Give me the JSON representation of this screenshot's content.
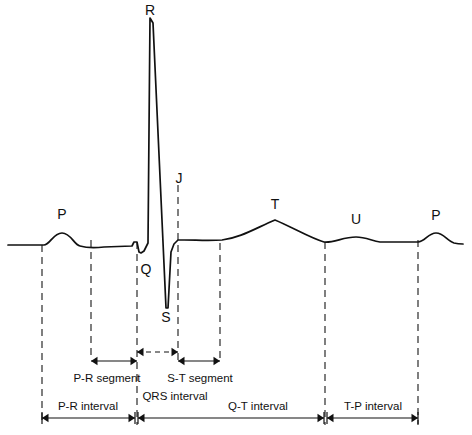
{
  "figure": {
    "background_color": "#ffffff",
    "line_color": "#111111",
    "width": 472,
    "height": 435
  },
  "wave_labels": [
    {
      "name": "p-wave-first",
      "text": "P",
      "x": 62,
      "y": 219
    },
    {
      "name": "r-wave",
      "text": "R",
      "x": 150,
      "y": 15
    },
    {
      "name": "q-wave",
      "text": "Q",
      "x": 146,
      "y": 274
    },
    {
      "name": "s-wave",
      "text": "S",
      "x": 166,
      "y": 322
    },
    {
      "name": "j-point",
      "text": "J",
      "x": 179,
      "y": 183
    },
    {
      "name": "t-wave",
      "text": "T",
      "x": 275,
      "y": 209
    },
    {
      "name": "u-wave",
      "text": "U",
      "x": 356,
      "y": 224
    },
    {
      "name": "p-wave-second",
      "text": "P",
      "x": 436,
      "y": 220
    }
  ],
  "guide_lines": [
    {
      "name": "guide-p-onset",
      "x": 42,
      "y1": 245,
      "y2": 425
    },
    {
      "name": "guide-p-offset",
      "x": 91,
      "y1": 240,
      "y2": 360
    },
    {
      "name": "guide-q-onset",
      "x": 137,
      "y1": 242,
      "y2": 425
    },
    {
      "name": "guide-j-point",
      "x": 178,
      "y1": 185,
      "y2": 360
    },
    {
      "name": "guide-st-end",
      "x": 220,
      "y1": 243,
      "y2": 360
    },
    {
      "name": "guide-t-offset",
      "x": 325,
      "y1": 242,
      "y2": 425
    },
    {
      "name": "guide-p2-onset",
      "x": 418,
      "y1": 240,
      "y2": 425
    }
  ],
  "annotations": {
    "segments": [
      {
        "name": "pr-segment",
        "label": "P-R segment",
        "x1": 91,
        "x2": 137,
        "y": 361,
        "label_x": 107,
        "label_y": 382,
        "style": "solid"
      },
      {
        "name": "qrs-interval",
        "label": "QRS interval",
        "x1": 137,
        "x2": 178,
        "y": 352,
        "label_x": 175,
        "label_y": 400,
        "style": "dashed"
      },
      {
        "name": "st-segment",
        "label": "S-T segment",
        "x1": 178,
        "x2": 220,
        "y": 361,
        "label_x": 200,
        "label_y": 382,
        "style": "solid"
      }
    ],
    "intervals": [
      {
        "name": "pr-interval",
        "label": "P-R interval",
        "x1": 42,
        "x2": 135,
        "y": 418,
        "label_x": 88,
        "label_y": 410
      },
      {
        "name": "qt-interval",
        "label": "Q-T interval",
        "x1": 138,
        "x2": 324,
        "y": 418,
        "label_x": 258,
        "label_y": 410
      },
      {
        "name": "tp-interval",
        "label": "T-P interval",
        "x1": 327,
        "x2": 418,
        "y": 418,
        "label_x": 373,
        "label_y": 410
      }
    ]
  },
  "chart_data": {
    "type": "line",
    "xlabel": "",
    "ylabel": "",
    "baseline_y": 245,
    "trace_path": "M 8,245 L 44,245 C 50,245 53,233 62,233 C 71,233 74,245 80,246 C 87,248 95,248 104,247 L 132,246 L 134,242 L 137,242 L 139,252 L 141,253 L 144,251 L 148,243 L 150,18 L 153,23 L 166,308 L 168,308 L 171,252 L 174,244 L 178,240 L 184,240 C 196,240 208,241 222,240 C 240,238 256,228 275,220 C 294,228 310,238 324,242 C 334,243 343,237 356,237 C 366,237 372,241 380,242 L 418,242 C 425,242 428,233 436,233 C 444,233 447,241 454,243 C 458,244 460,244 463,244",
    "features": [
      {
        "label": "P",
        "peak_x": 62,
        "peak_y": 233,
        "amplitude": "small positive"
      },
      {
        "label": "Q",
        "peak_x": 140,
        "peak_y": 253,
        "amplitude": "small negative"
      },
      {
        "label": "R",
        "peak_x": 151,
        "peak_y": 18,
        "amplitude": "large positive"
      },
      {
        "label": "S",
        "peak_x": 167,
        "peak_y": 308,
        "amplitude": "large negative"
      },
      {
        "label": "J",
        "peak_x": 178,
        "peak_y": 240,
        "amplitude": "junction point"
      },
      {
        "label": "T",
        "peak_x": 275,
        "peak_y": 220,
        "amplitude": "moderate positive"
      },
      {
        "label": "U",
        "peak_x": 356,
        "peak_y": 237,
        "amplitude": "small positive"
      },
      {
        "label": "P2",
        "peak_x": 436,
        "peak_y": 233,
        "amplitude": "small positive"
      }
    ]
  }
}
